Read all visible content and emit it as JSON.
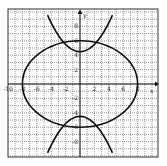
{
  "chart_data": {
    "type": "line",
    "title": "",
    "xlabel": "x",
    "ylabel": "y",
    "xlim": [
      -10,
      10
    ],
    "ylim": [
      -10,
      10
    ],
    "grid": true,
    "grid_step": 1,
    "x_tick_labels": [
      "-10",
      "-8",
      "-6",
      "-4",
      "-2",
      "2",
      "4",
      "6",
      "8"
    ],
    "x_tick_values": [
      -10,
      -8,
      -6,
      -4,
      -2,
      2,
      4,
      6,
      8
    ],
    "y_tick_labels": [
      "8",
      "6",
      "4",
      "2",
      "-2",
      "-4",
      "-6",
      "-8"
    ],
    "y_tick_values": [
      8,
      6,
      4,
      2,
      -2,
      -4,
      -6,
      -8
    ],
    "series": [
      {
        "name": "ellipse",
        "shape": "ellipse",
        "center": [
          0,
          0
        ],
        "rx": 8,
        "ry": 6
      },
      {
        "name": "upper-parabola",
        "shape": "parabola",
        "vertex": [
          0,
          4.5
        ],
        "opens": "up",
        "a": 0.25
      },
      {
        "name": "lower-parabola",
        "shape": "parabola",
        "vertex": [
          0,
          -4.5
        ],
        "opens": "down",
        "a": -0.25
      }
    ]
  }
}
